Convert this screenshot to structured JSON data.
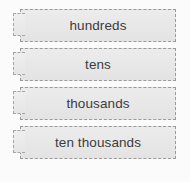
{
  "canvas": {
    "width": 190,
    "height": 182,
    "background_color": "#fbfbfb"
  },
  "widget": {
    "kind": "drag-and-drop-label-list",
    "tile_fill_color": "#e8e8e8",
    "tile_border_color": "#9a9a9a",
    "tile_border_style": "dashed",
    "text_color": "#3c3c3c",
    "handle_name": "drag-handle"
  },
  "rows": [
    {
      "label": "hundreds",
      "ghost": ""
    },
    {
      "label": "tens",
      "ghost": ""
    },
    {
      "label": "thousands",
      "ghost": ""
    },
    {
      "label": "ten thousands",
      "ghost": ""
    }
  ]
}
